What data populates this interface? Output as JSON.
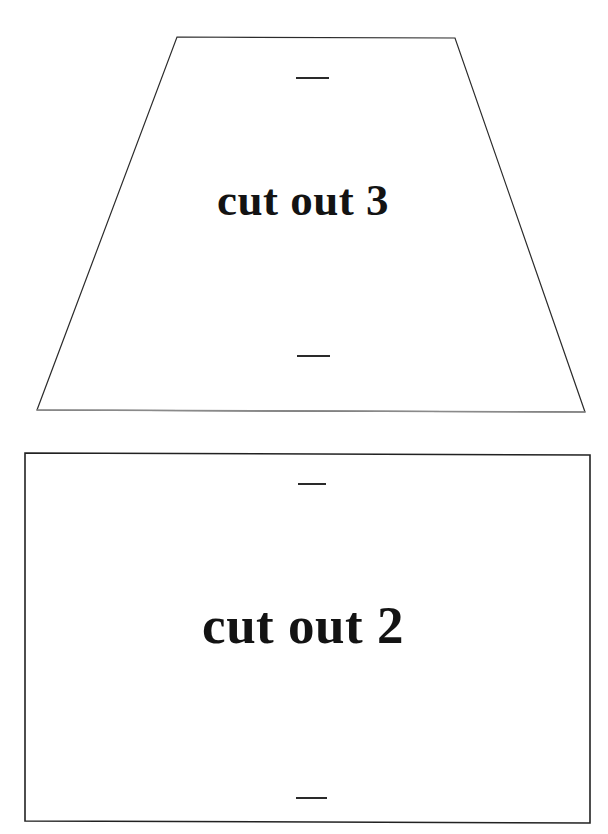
{
  "document": {
    "title": "cut out template sheet",
    "background_color": "#ffffff",
    "ink_color": "#1a1a1a",
    "width": 608,
    "height": 834
  },
  "pieces": [
    {
      "id": "piece-3",
      "shape": "trapezoid",
      "label": "cut out 3",
      "outline_color": "#2b2b2b",
      "outline_width": 1.2,
      "points": "177,37 455,38 585,412 37,410",
      "tick_marks": [
        {
          "name": "tick-trapezoid-top",
          "x": 296,
          "y": 77,
          "length": 33
        },
        {
          "name": "tick-trapezoid-bottom",
          "x": 297,
          "y": 355,
          "length": 33
        }
      ]
    },
    {
      "id": "piece-2",
      "shape": "rectangle",
      "label": "cut out 2",
      "outline_color": "#222222",
      "outline_width": 1.6,
      "points": "25,453 590,455 590,823 25,821",
      "tick_marks": [
        {
          "name": "tick-rectangle-top",
          "x": 298,
          "y": 483,
          "length": 28
        },
        {
          "name": "tick-rectangle-bottom",
          "x": 296,
          "y": 797,
          "length": 31
        }
      ]
    }
  ],
  "labels": {
    "cut_out_3": "cut out 3",
    "cut_out_2": "cut out 2"
  }
}
